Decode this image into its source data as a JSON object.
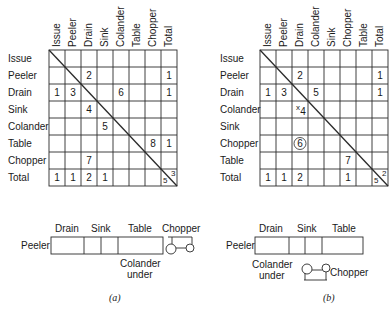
{
  "panel_a": {
    "caption": "(a)",
    "columns": [
      "Issue",
      "Peeler",
      "Drain",
      "Sink",
      "Colander",
      "Table",
      "Chopper",
      "Total"
    ],
    "rows": [
      "Issue",
      "Peeler",
      "Drain",
      "Sink",
      "Colander",
      "Table",
      "Chopper",
      "Total"
    ],
    "cells": [
      {
        "row": 1,
        "col": 2,
        "value": "2"
      },
      {
        "row": 1,
        "col": 7,
        "value": "1"
      },
      {
        "row": 2,
        "col": 0,
        "value": "1"
      },
      {
        "row": 2,
        "col": 1,
        "value": "3"
      },
      {
        "row": 2,
        "col": 4,
        "value": "6"
      },
      {
        "row": 2,
        "col": 7,
        "value": "1"
      },
      {
        "row": 3,
        "col": 2,
        "value": "4"
      },
      {
        "row": 4,
        "col": 3,
        "value": "5"
      },
      {
        "row": 5,
        "col": 6,
        "value": "8"
      },
      {
        "row": 5,
        "col": 7,
        "value": "1"
      },
      {
        "row": 6,
        "col": 2,
        "value": "7"
      },
      {
        "row": 7,
        "col": 0,
        "value": "1"
      },
      {
        "row": 7,
        "col": 1,
        "value": "1"
      },
      {
        "row": 7,
        "col": 2,
        "value": "2"
      },
      {
        "row": 7,
        "col": 3,
        "value": "1"
      }
    ],
    "corner_upper": "3",
    "corner_lower": "5",
    "layout": {
      "left_label": "Peeler",
      "top_labels": [
        "Drain",
        "Sink",
        "Table",
        "Chopper"
      ],
      "bottom_label_line1": "Colander",
      "bottom_label_line2": "under"
    }
  },
  "panel_b": {
    "caption": "(b)",
    "columns": [
      "Issue",
      "Peeler",
      "Drain",
      "Colander",
      "Sink",
      "Chopper",
      "Table",
      "Total"
    ],
    "rows": [
      "Issue",
      "Peeler",
      "Drain",
      "Colander",
      "Sink",
      "Chopper",
      "Table",
      "Total"
    ],
    "cells": [
      {
        "row": 1,
        "col": 2,
        "value": "2"
      },
      {
        "row": 1,
        "col": 7,
        "value": "1"
      },
      {
        "row": 2,
        "col": 0,
        "value": "1"
      },
      {
        "row": 2,
        "col": 1,
        "value": "3"
      },
      {
        "row": 2,
        "col": 3,
        "value": "5"
      },
      {
        "row": 2,
        "col": 7,
        "value": "1"
      },
      {
        "row": 3,
        "col": 2,
        "value": "4",
        "mark": "x"
      },
      {
        "row": 5,
        "col": 2,
        "value": "6",
        "circled": true
      },
      {
        "row": 6,
        "col": 5,
        "value": "7"
      },
      {
        "row": 7,
        "col": 0,
        "value": "1"
      },
      {
        "row": 7,
        "col": 1,
        "value": "1"
      },
      {
        "row": 7,
        "col": 2,
        "value": "2"
      },
      {
        "row": 7,
        "col": 5,
        "value": "1"
      }
    ],
    "corner_upper": "2",
    "corner_lower": "5",
    "layout": {
      "left_label": "Peeler",
      "top_labels": [
        "Drain",
        "Sink",
        "Table"
      ],
      "bottom_label_line1": "Colander",
      "bottom_label_line2": "under",
      "chopper_label": "Chopper"
    }
  }
}
